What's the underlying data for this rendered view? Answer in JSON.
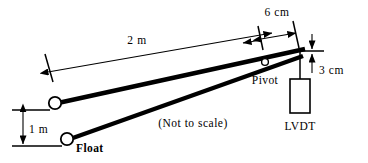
{
  "diagram": {
    "note": "(Not to scale)",
    "colors": {
      "stroke": "#000000",
      "background": "#ffffff",
      "fill": "#ffffff"
    },
    "dimensions": [
      {
        "id": "lever-length",
        "label": "2 m",
        "value": 2,
        "unit": "m"
      },
      {
        "id": "pivot-offset",
        "label": "6 cm",
        "value": 6,
        "unit": "cm"
      },
      {
        "id": "lvdt-travel",
        "label": "3 cm",
        "value": 3,
        "unit": "cm"
      },
      {
        "id": "float-rise",
        "label": "1 m",
        "value": 1,
        "unit": "m"
      }
    ],
    "parts": [
      {
        "id": "pivot",
        "label": "Pivot"
      },
      {
        "id": "lvdt",
        "label": "LVDT"
      },
      {
        "id": "float",
        "label": "Float"
      }
    ]
  }
}
